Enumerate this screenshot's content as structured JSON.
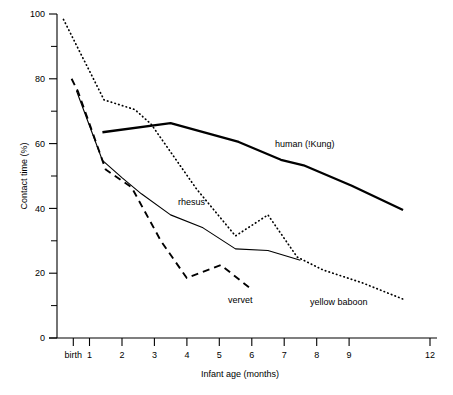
{
  "chart_data": {
    "type": "line",
    "title": "",
    "xlabel": "Infant age (months)",
    "ylabel": "Contact time (%)",
    "ylim": [
      0,
      100
    ],
    "xlim": [
      0,
      12
    ],
    "grid": false,
    "legend_position": "inline-annotations",
    "y_ticks_major": [
      0,
      20,
      40,
      60,
      80,
      100
    ],
    "y_ticks_minor": [
      10,
      30,
      50,
      70,
      90
    ],
    "y_tick_labels": [
      "0",
      "20",
      "40",
      "60",
      "80",
      "100"
    ],
    "x_ticks": [
      0.5,
      1,
      2,
      3,
      4,
      5,
      6,
      7,
      8,
      9,
      12
    ],
    "x_tick_labels": [
      "birth",
      "1",
      "2",
      "3",
      "4",
      "5",
      "6",
      "7",
      "8",
      "9",
      "12"
    ],
    "x_axis_note": "spacing between 9 and 12 is compressed (axis break)",
    "series": [
      {
        "name": "human (!Kung)",
        "style": "solid-thick",
        "label": "human (!Kung)",
        "points": [
          [
            1.4,
            63.5
          ],
          [
            3.5,
            66.3
          ],
          [
            5.6,
            60.5
          ],
          [
            6.9,
            55.0
          ],
          [
            7.6,
            53.3
          ],
          [
            9.1,
            47.0
          ],
          [
            11.0,
            39.5
          ]
        ]
      },
      {
        "name": "rhesus",
        "style": "solid-thin",
        "label": "rhesus",
        "points": [
          [
            0.6,
            76.3
          ],
          [
            1.4,
            54.8
          ],
          [
            2.0,
            49.5
          ],
          [
            2.6,
            44.5
          ],
          [
            3.5,
            38.0
          ],
          [
            4.5,
            34.0
          ],
          [
            5.5,
            27.5
          ],
          [
            6.5,
            27.0
          ],
          [
            7.5,
            24.0
          ]
        ]
      },
      {
        "name": "vervet",
        "style": "dashed",
        "label": "vervet",
        "points": [
          [
            0.45,
            80.0
          ],
          [
            0.65,
            76.0
          ],
          [
            1.5,
            52.0
          ],
          [
            2.3,
            46.5
          ],
          [
            3.2,
            30.0
          ],
          [
            4.0,
            18.5
          ],
          [
            5.05,
            22.5
          ],
          [
            6.0,
            15.0
          ]
        ]
      },
      {
        "name": "yellow baboon",
        "style": "dotted",
        "label": "yellow baboon",
        "points": [
          [
            0.2,
            98.3
          ],
          [
            1.45,
            73.5
          ],
          [
            2.4,
            70.5
          ],
          [
            2.9,
            66.0
          ],
          [
            4.3,
            46.0
          ],
          [
            5.5,
            31.5
          ],
          [
            6.5,
            38.0
          ],
          [
            7.4,
            25.0
          ],
          [
            8.2,
            21.0
          ],
          [
            9.5,
            17.0
          ],
          [
            11.0,
            12.0
          ]
        ]
      }
    ],
    "annotations": [
      {
        "text": "human (!Kung)",
        "x": 275,
        "y": 147
      },
      {
        "text": "rhesus",
        "x": 178,
        "y": 205
      },
      {
        "text": "vervet",
        "x": 228,
        "y": 303
      },
      {
        "text": "yellow baboon",
        "x": 310,
        "y": 305
      }
    ]
  }
}
